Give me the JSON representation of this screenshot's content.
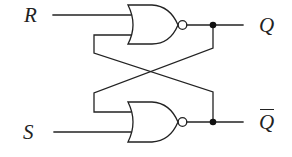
{
  "diagram": {
    "type": "SR latch (cross-coupled NOR gates)",
    "inputs": [
      {
        "label": "R"
      },
      {
        "label": "S"
      }
    ],
    "outputs": [
      {
        "label": "Q"
      },
      {
        "label": "Q",
        "overbar": true
      }
    ],
    "gates": [
      {
        "type": "NOR",
        "position": "top",
        "inputs": [
          "R",
          "Q̄ (feedback)"
        ],
        "output": "Q"
      },
      {
        "type": "NOR",
        "position": "bottom",
        "inputs": [
          "Q (feedback)",
          "S"
        ],
        "output": "Q̄"
      }
    ],
    "colors": {
      "line": "#222222",
      "background": "#ffffff"
    }
  }
}
